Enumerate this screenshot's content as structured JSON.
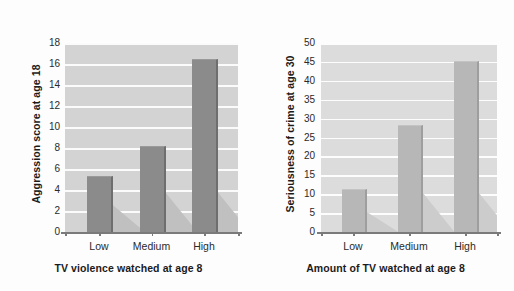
{
  "figure": {
    "background": "#fdfdfd",
    "panel_count": 2
  },
  "chart_data": [
    {
      "id": "left",
      "type": "bar",
      "title": "",
      "xlabel": "TV violence watched at age 8",
      "ylabel": "Aggression score at age 18",
      "categories": [
        "Low",
        "Medium",
        "High"
      ],
      "values": [
        5.2,
        8.1,
        16.4
      ],
      "ylim": [
        0,
        18
      ],
      "ytick_step": 2,
      "yticks": [
        "0",
        "2",
        "4",
        "6",
        "8",
        "10",
        "12",
        "14",
        "16",
        "18"
      ],
      "grid": true,
      "legend": "none",
      "bar_color": "#8b8b8b",
      "plot_background": "#d3d3d3",
      "gridline_color": "#fbfbfb"
    },
    {
      "id": "right",
      "type": "bar",
      "title": "",
      "xlabel": "Amount of TV watched at age 8",
      "ylabel": "Seriousness of crime at age 30",
      "categories": [
        "Low",
        "Medium",
        "High"
      ],
      "values": [
        11,
        28,
        45
      ],
      "ylim": [
        0,
        50
      ],
      "ytick_step": 5,
      "yticks": [
        "0",
        "5",
        "10",
        "15",
        "20",
        "25",
        "30",
        "35",
        "40",
        "45",
        "50"
      ],
      "grid": true,
      "legend": "none",
      "bar_color": "#b7b7b7",
      "plot_background": "#dcdcdc",
      "gridline_color": "#fdfdfd"
    }
  ]
}
